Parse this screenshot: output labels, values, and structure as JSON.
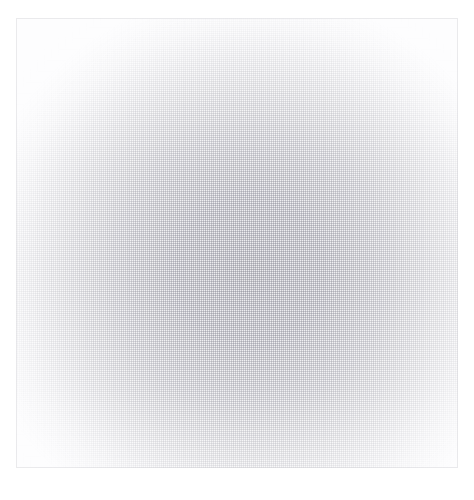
{
  "document": {
    "kind": "blank-page",
    "description": "Near-blank light page with a faint dithered halftone texture; no legible text, icons, or controls are present.",
    "visible_text": "",
    "page_background_color": "#ffffff",
    "panel": {
      "name": "blank-content-panel",
      "fill_color": "#fbfbfc",
      "center_shade_color": "#ececef",
      "edge_shade_color": "#fdfdfe",
      "border_color": "#d2d2d8",
      "texture": "ordered-dither-halftone",
      "bounds": {
        "left": 16,
        "top": 18,
        "width": 442,
        "height": 450
      },
      "shading": {
        "type": "radial",
        "center_x_pct": 53,
        "center_y_pct": 56
      }
    },
    "content_items": [],
    "empty_state_label": ""
  }
}
